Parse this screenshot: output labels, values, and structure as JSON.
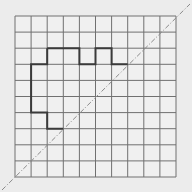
{
  "diagram": {
    "type": "grid-with-outline-and-symmetry-line",
    "grid": {
      "rows": 10,
      "cols": 10,
      "x0": 15,
      "y0": 16,
      "cell": 16.1,
      "line_color": "#707070",
      "bg": "#f0f0f0"
    },
    "outline": {
      "color": "#3a3a3a",
      "points_grid": [
        [
          2,
          2
        ],
        [
          4,
          2
        ],
        [
          4,
          3
        ],
        [
          5,
          3
        ],
        [
          5,
          2
        ],
        [
          6,
          2
        ],
        [
          6,
          3
        ],
        [
          7,
          3
        ]
      ],
      "points_grid_left": [
        [
          2,
          2
        ],
        [
          2,
          3
        ],
        [
          1,
          3
        ],
        [
          1,
          6
        ],
        [
          2,
          6
        ],
        [
          2,
          7
        ],
        [
          3,
          7
        ]
      ]
    },
    "diagonal": {
      "from": [
        2,
        190
      ],
      "to": [
        190,
        4
      ],
      "color": "#8a8a8a",
      "style": "dash-dot"
    }
  }
}
